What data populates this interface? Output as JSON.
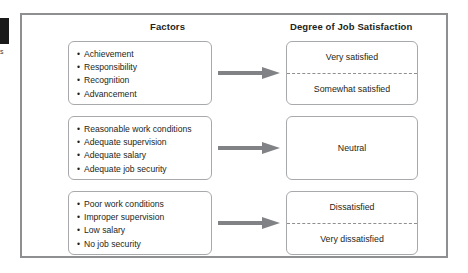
{
  "figure": {
    "edge_tab_fragment": "s",
    "headers": {
      "left": "Factors",
      "right": "Degree of Job Satisfaction"
    },
    "colors": {
      "frame_border": "#8d8f91",
      "box_border": "#a7a9ac",
      "arrow": "#808285",
      "text": "#231f20",
      "background": "#ffffff"
    },
    "rows": [
      {
        "factors": [
          "Achievement",
          "Responsibility",
          "Recognition",
          "Advancement"
        ],
        "arrow": "right-arrow-icon",
        "outcomes": [
          "Very satisfied",
          "Somewhat satisfied"
        ],
        "divided": true
      },
      {
        "factors": [
          "Reasonable work conditions",
          "Adequate supervision",
          "Adequate salary",
          "Adequate job security"
        ],
        "arrow": "right-arrow-icon",
        "outcomes": [
          "Neutral"
        ],
        "divided": false
      },
      {
        "factors": [
          "Poor work conditions",
          "Improper supervision",
          "Low salary",
          "No job security"
        ],
        "arrow": "right-arrow-icon",
        "outcomes": [
          "Dissatisfied",
          "Very dissatisfied"
        ],
        "divided": true
      }
    ]
  }
}
